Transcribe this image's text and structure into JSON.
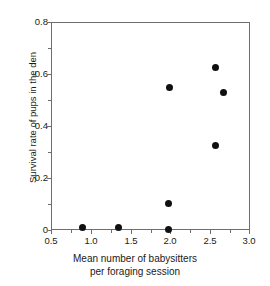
{
  "chart_data": {
    "type": "scatter",
    "title": "",
    "xlabel_line1": "Mean number of babysitters",
    "xlabel_line2": "per foraging session",
    "ylabel": "Survival rate of pups in the den",
    "xlim": [
      0.5,
      3.0
    ],
    "ylim": [
      0.0,
      0.8
    ],
    "xticks": [
      0.5,
      1.0,
      1.5,
      2.0,
      2.5,
      3.0
    ],
    "xticklabels": [
      "0.5",
      "1.0",
      "1.5",
      "2.0",
      "2.5",
      "3.0"
    ],
    "yticks": [
      0.0,
      0.2,
      0.4,
      0.6,
      0.8
    ],
    "yticklabels": [
      "0",
      "0.2",
      "0.4",
      "0.6",
      "0.8"
    ],
    "y_minor_ticks": [
      0.1,
      0.3,
      0.5,
      0.7
    ],
    "x_minor_ticks": [
      0.75,
      1.25,
      1.75,
      2.25,
      2.75
    ],
    "grid": false,
    "legend": null,
    "marker": "filled-circle",
    "marker_color": "#101010",
    "frame_color": "#6e6e6e",
    "background": "#ffffff",
    "points": [
      {
        "x": 0.88,
        "y": 0.015
      },
      {
        "x": 1.33,
        "y": 0.015
      },
      {
        "x": 1.96,
        "y": 0.005
      },
      {
        "x": 1.96,
        "y": 0.105
      },
      {
        "x": 1.97,
        "y": 0.553
      },
      {
        "x": 2.56,
        "y": 0.628
      },
      {
        "x": 2.65,
        "y": 0.532
      },
      {
        "x": 2.56,
        "y": 0.33
      }
    ]
  }
}
